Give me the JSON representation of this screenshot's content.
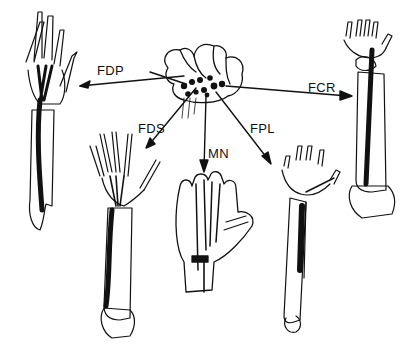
{
  "figure": {
    "labels": [
      {
        "id": "fdp",
        "text": "FDP",
        "x": 97,
        "y": 64
      },
      {
        "id": "fds",
        "text": "FDS",
        "x": 138,
        "y": 122
      },
      {
        "id": "mn",
        "text": "MN",
        "x": 208,
        "y": 147
      },
      {
        "id": "fpl",
        "text": "FPL",
        "x": 250,
        "y": 122
      },
      {
        "id": "fcr",
        "text": "FCR",
        "x": 308,
        "y": 81
      }
    ],
    "colors": {
      "ink": "#111111",
      "paper": "#ffffff"
    }
  }
}
